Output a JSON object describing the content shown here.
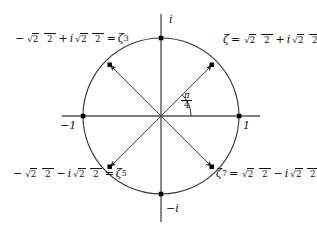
{
  "figure": {
    "colors": {
      "background": "#ffffff",
      "stroke": "#333333",
      "text": "#111111",
      "point": "#000000"
    },
    "geometry": {
      "center_x": 161,
      "center_y": 116,
      "radius": 78,
      "x_axis_start": 62,
      "x_axis_end": 260,
      "y_axis_start": 14,
      "y_axis_end": 222,
      "angle_arc_radius": 30
    }
  },
  "axis_labels": {
    "imaginary_positive": "i",
    "imaginary_negative": "−i",
    "real_positive": "1",
    "real_negative": "−1"
  },
  "angle": {
    "numerator": "π",
    "denominator": "4",
    "value_text": "π/4",
    "degrees": 45
  },
  "roots": [
    {
      "name": "zeta",
      "power": "1",
      "quadrant": 1,
      "angle_deg": 45,
      "label_text": "ζ = √2/2 + i√2/2",
      "lhs_symbol": "ζ",
      "equals": "=",
      "real_sign": "",
      "imag_sign": "+",
      "radicand": "2",
      "denominator": "2",
      "imaginary_unit": "i",
      "order": "lhs-first"
    },
    {
      "name": "zeta-cubed",
      "power": "3",
      "quadrant": 2,
      "angle_deg": 135,
      "label_text": "−√2/2 + i√2/2 = ζ³",
      "lhs_symbol": "ζ",
      "equals": "=",
      "real_sign": "−",
      "imag_sign": "+",
      "radicand": "2",
      "denominator": "2",
      "imaginary_unit": "i",
      "order": "value-first"
    },
    {
      "name": "zeta-fifth",
      "power": "5",
      "quadrant": 3,
      "angle_deg": 225,
      "label_text": "−√2/2 − i√2/2 = ζ⁵",
      "lhs_symbol": "ζ",
      "equals": "=",
      "real_sign": "−",
      "imag_sign": "−",
      "radicand": "2",
      "denominator": "2",
      "imaginary_unit": "i",
      "order": "value-first"
    },
    {
      "name": "zeta-seventh",
      "power": "7",
      "quadrant": 4,
      "angle_deg": 315,
      "label_text": "ζ⁷ = √2/2 − i√2/2",
      "lhs_symbol": "ζ",
      "equals": "=",
      "real_sign": "",
      "imag_sign": "−",
      "radicand": "2",
      "denominator": "2",
      "imaginary_unit": "i",
      "order": "lhs-first"
    }
  ],
  "symbols": {
    "zeta": "ζ",
    "equals": "=",
    "plus": "+",
    "minus": "−",
    "sqrt": "√",
    "two": "2",
    "four": "4",
    "pi": "π",
    "i": "i"
  }
}
